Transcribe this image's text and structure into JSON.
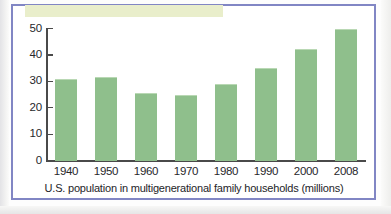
{
  "figure": {
    "frame_color": "#8186c4",
    "band_color": "#e9eecb",
    "bar_color": "#8fbf8c",
    "axis_color": "#4a4a4a"
  },
  "chart_data": {
    "type": "bar",
    "title": "",
    "caption": "U.S. population in multigenerational family households (millions)",
    "xlabel": "",
    "ylabel": "",
    "categories": [
      "1940",
      "1950",
      "1960",
      "1970",
      "1980",
      "1990",
      "2000",
      "2008"
    ],
    "values": [
      31,
      31.5,
      25.5,
      24.8,
      29,
      35,
      42.3,
      49.7
    ],
    "ylim": [
      0,
      50
    ],
    "yticks": [
      0,
      10,
      20,
      30,
      40,
      50
    ],
    "ytick_labels": [
      "0",
      "10",
      "20",
      "30",
      "40",
      "50"
    ],
    "grid": false,
    "legend": null,
    "series": [
      {
        "name": "U.S. population in multigenerational family households (millions)",
        "values": [
          31,
          31.5,
          25.5,
          24.8,
          29,
          35,
          42.3,
          49.7
        ]
      }
    ]
  }
}
